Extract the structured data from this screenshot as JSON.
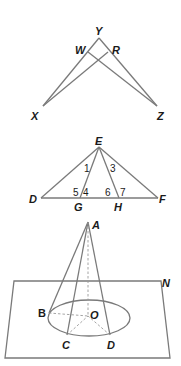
{
  "figures": [
    {
      "id": "fig1",
      "points": {
        "Y": "Y",
        "W": "W",
        "R": "R",
        "X": "X",
        "Z": "Z"
      }
    },
    {
      "id": "fig2",
      "points": {
        "E": "E",
        "D": "D",
        "F": "F",
        "G": "G",
        "H": "H"
      },
      "angles": {
        "a1": "1",
        "a3": "3",
        "a4": "4",
        "a5": "5",
        "a6": "6",
        "a7": "7"
      }
    },
    {
      "id": "fig3",
      "points": {
        "A": "A",
        "B": "B",
        "C": "C",
        "D": "D",
        "O": "O"
      },
      "plane": "N"
    }
  ],
  "colors": {
    "stroke": "#7a7a7a",
    "text": "#1a1a1a",
    "background": "#ffffff"
  }
}
